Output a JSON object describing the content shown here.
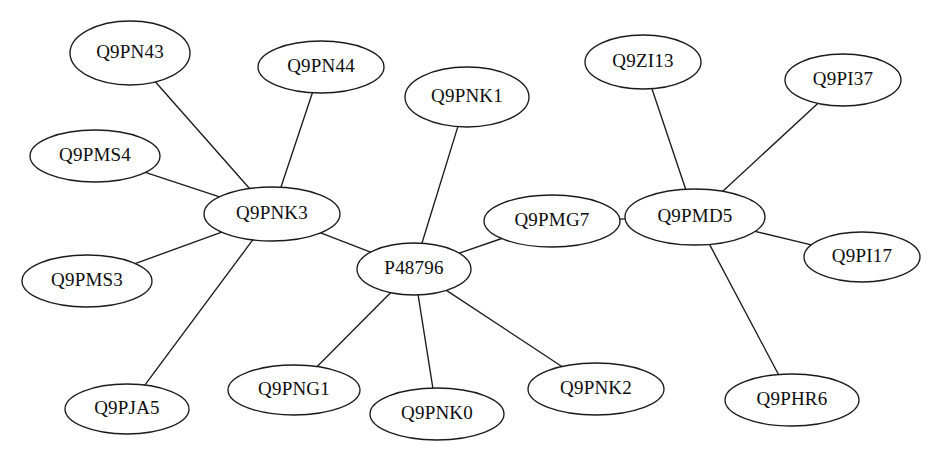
{
  "diagram": {
    "type": "node-link-graph",
    "background_color": "#ffffff",
    "node_fill_color": "#ffffff",
    "node_stroke_color": "#1b1b1b",
    "edge_color": "#1b1b1b",
    "label_color": "#0d0d0d",
    "node_count": 17,
    "edge_count": 16,
    "hub_nodes": [
      "Q9PNK3",
      "P48796",
      "Q9PMD5"
    ]
  },
  "nodes": [
    {
      "id": "Q9PN43",
      "label": "Q9PN43",
      "cx": 130,
      "cy": 53,
      "rx": 60,
      "ry": 32,
      "degree": 1
    },
    {
      "id": "Q9PN44",
      "label": "Q9PN44",
      "cx": 321,
      "cy": 67,
      "rx": 63,
      "ry": 26,
      "degree": 1
    },
    {
      "id": "Q9PNK1",
      "label": "Q9PNK1",
      "cx": 467,
      "cy": 97,
      "rx": 62,
      "ry": 30,
      "degree": 1
    },
    {
      "id": "Q9ZI13",
      "label": "Q9ZI13",
      "cx": 643,
      "cy": 62,
      "rx": 58,
      "ry": 27,
      "degree": 1
    },
    {
      "id": "Q9PI37",
      "label": "Q9PI37",
      "cx": 843,
      "cy": 80,
      "rx": 58,
      "ry": 26,
      "degree": 1
    },
    {
      "id": "Q9PMS4",
      "label": "Q9PMS4",
      "cx": 95,
      "cy": 156,
      "rx": 65,
      "ry": 26,
      "degree": 1
    },
    {
      "id": "Q9PNK3",
      "label": "Q9PNK3",
      "cx": 272,
      "cy": 214,
      "rx": 68,
      "ry": 27,
      "degree": 6
    },
    {
      "id": "Q9PMG7",
      "label": "Q9PMG7",
      "cx": 552,
      "cy": 221,
      "rx": 68,
      "ry": 26,
      "degree": 2
    },
    {
      "id": "Q9PMD5",
      "label": "Q9PMD5",
      "cx": 695,
      "cy": 217,
      "rx": 70,
      "ry": 28,
      "degree": 5
    },
    {
      "id": "P48796",
      "label": "P48796",
      "cx": 414,
      "cy": 269,
      "rx": 57,
      "ry": 26,
      "degree": 6
    },
    {
      "id": "Q9PI17",
      "label": "Q9PI17",
      "cx": 862,
      "cy": 257,
      "rx": 58,
      "ry": 25,
      "degree": 1
    },
    {
      "id": "Q9PMS3",
      "label": "Q9PMS3",
      "cx": 87,
      "cy": 281,
      "rx": 65,
      "ry": 26,
      "degree": 1
    },
    {
      "id": "Q9PNG1",
      "label": "Q9PNG1",
      "cx": 294,
      "cy": 390,
      "rx": 66,
      "ry": 25,
      "degree": 1
    },
    {
      "id": "Q9PNK2",
      "label": "Q9PNK2",
      "cx": 596,
      "cy": 389,
      "rx": 68,
      "ry": 26,
      "degree": 1
    },
    {
      "id": "Q9PJA5",
      "label": "Q9PJA5",
      "cx": 127,
      "cy": 409,
      "rx": 62,
      "ry": 25,
      "degree": 1
    },
    {
      "id": "Q9PNK0",
      "label": "Q9PNK0",
      "cx": 437,
      "cy": 414,
      "rx": 67,
      "ry": 26,
      "degree": 1
    },
    {
      "id": "Q9PHR6",
      "label": "Q9PHR6",
      "cx": 792,
      "cy": 400,
      "rx": 67,
      "ry": 26,
      "degree": 1
    }
  ],
  "edges": [
    {
      "source": "Q9PN43",
      "target": "Q9PNK3"
    },
    {
      "source": "Q9PN44",
      "target": "Q9PNK3"
    },
    {
      "source": "Q9PMS4",
      "target": "Q9PNK3"
    },
    {
      "source": "Q9PMS3",
      "target": "Q9PNK3"
    },
    {
      "source": "Q9PJA5",
      "target": "Q9PNK3"
    },
    {
      "source": "Q9PNK3",
      "target": "P48796"
    },
    {
      "source": "Q9PNK1",
      "target": "P48796"
    },
    {
      "source": "P48796",
      "target": "Q9PMG7"
    },
    {
      "source": "P48796",
      "target": "Q9PNG1"
    },
    {
      "source": "P48796",
      "target": "Q9PNK0"
    },
    {
      "source": "P48796",
      "target": "Q9PNK2"
    },
    {
      "source": "Q9PMG7",
      "target": "Q9PMD5"
    },
    {
      "source": "Q9ZI13",
      "target": "Q9PMD5"
    },
    {
      "source": "Q9PI37",
      "target": "Q9PMD5"
    },
    {
      "source": "Q9PMD5",
      "target": "Q9PI17"
    },
    {
      "source": "Q9PMD5",
      "target": "Q9PHR6"
    }
  ]
}
